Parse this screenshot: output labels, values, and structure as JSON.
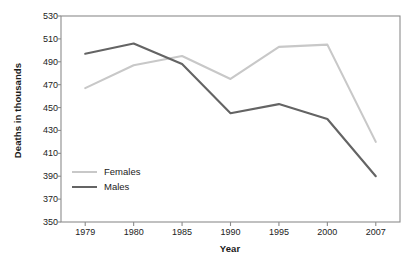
{
  "chart_data": {
    "type": "line",
    "title": "",
    "xlabel": "Year",
    "ylabel": "Deaths in thousands",
    "categories": [
      "1979",
      "1980",
      "1985",
      "1990",
      "1995",
      "2000",
      "2007"
    ],
    "series": [
      {
        "name": "Females",
        "color": "#c8c8c8",
        "values": [
          467,
          487,
          495,
          475,
          503,
          505,
          420
        ]
      },
      {
        "name": "Males",
        "color": "#646464",
        "values": [
          497,
          506,
          488,
          445,
          453,
          440,
          390
        ]
      }
    ],
    "ylim": [
      350,
      530
    ],
    "ytick_step": 20,
    "yticks": [
      "350",
      "370",
      "390",
      "410",
      "430",
      "450",
      "470",
      "490",
      "510",
      "530"
    ],
    "grid": false,
    "legend_position": "inside-lower-left",
    "frame": true,
    "frame_color": "#8c8c8c",
    "axis_label_color": "#222222"
  },
  "axes": {
    "y_title": "Deaths in thousands",
    "x_title": "Year"
  },
  "legend": {
    "entries": [
      {
        "label": "Females",
        "color": "#c8c8c8"
      },
      {
        "label": "Males",
        "color": "#646464"
      }
    ]
  }
}
